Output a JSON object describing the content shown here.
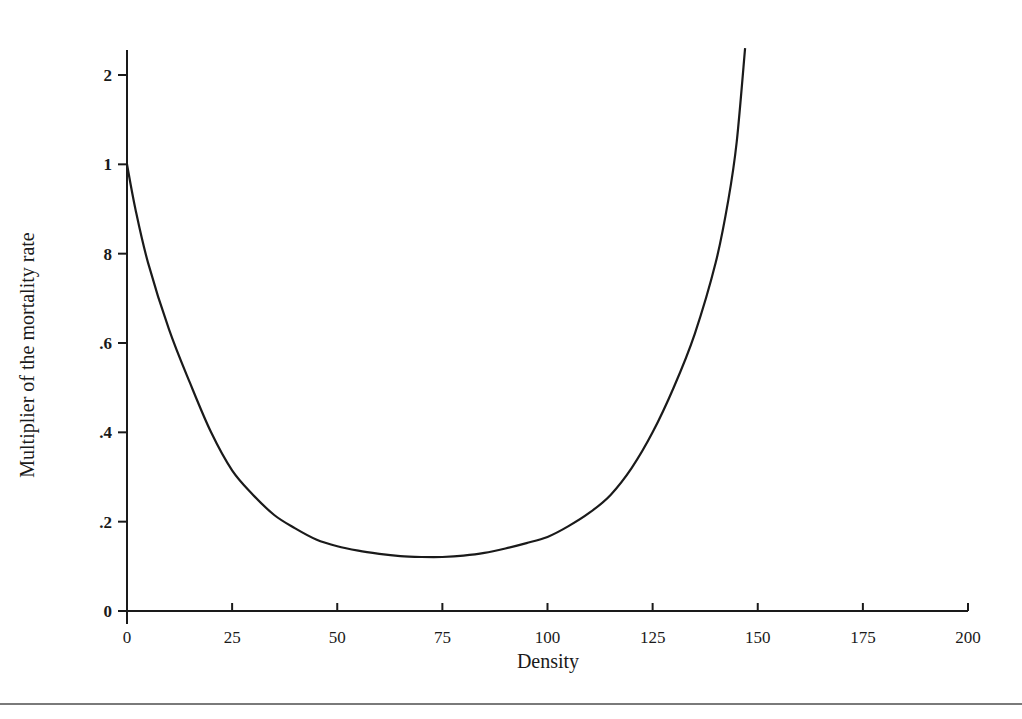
{
  "chart_data": {
    "type": "line",
    "title": "",
    "xlabel": "Density",
    "ylabel": "Multiplier of the mortality rate",
    "xlim": [
      0,
      200
    ],
    "ylim": [
      0,
      1.2
    ],
    "grid": false,
    "legend": null,
    "x_ticks": [
      0,
      25,
      50,
      75,
      100,
      125,
      150,
      175,
      200
    ],
    "x_tick_labels": [
      "0",
      "25",
      "50",
      "75",
      "100",
      "125",
      "150",
      "175",
      "200"
    ],
    "y_ticks": [
      0,
      0.2,
      0.4,
      0.6,
      0.8,
      1.0,
      1.2
    ],
    "y_tick_labels": [
      "0",
      ".2",
      ".4",
      ".6",
      "8",
      "1",
      "2"
    ],
    "series": [
      {
        "name": "mortality multiplier",
        "color": "#1a1a1a",
        "x": [
          0,
          2,
          5,
          10,
          15,
          20,
          25,
          30,
          35,
          40,
          45,
          50,
          55,
          60,
          65,
          70,
          75,
          80,
          85,
          90,
          95,
          100,
          105,
          110,
          115,
          120,
          125,
          130,
          135,
          140,
          143,
          145,
          147
        ],
        "y": [
          1.0,
          0.9,
          0.78,
          0.63,
          0.51,
          0.4,
          0.315,
          0.26,
          0.215,
          0.185,
          0.16,
          0.145,
          0.135,
          0.128,
          0.123,
          0.121,
          0.121,
          0.124,
          0.13,
          0.14,
          0.152,
          0.166,
          0.19,
          0.22,
          0.26,
          0.32,
          0.4,
          0.5,
          0.62,
          0.78,
          0.92,
          1.05,
          1.26
        ]
      }
    ]
  }
}
